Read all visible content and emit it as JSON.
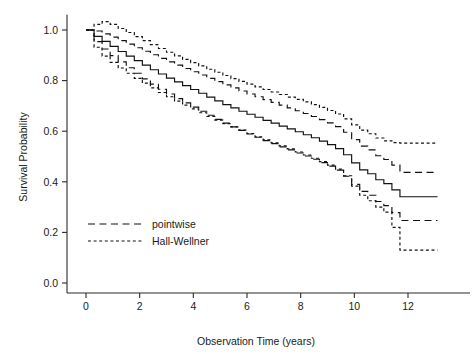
{
  "chart_data": {
    "type": "line",
    "title": "",
    "subtitle": "",
    "xlabel": "Observation Time (years)",
    "ylabel": "Survival Probability",
    "xlim": [
      -0.55,
      13.2
    ],
    "ylim": [
      -0.03,
      1.06
    ],
    "xticks": [
      0,
      2,
      4,
      6,
      8,
      10,
      12
    ],
    "xticklabels": [
      "0",
      "2",
      "4",
      "6",
      "8",
      "10",
      "12"
    ],
    "yticks": [
      0.0,
      0.2,
      0.4,
      0.6,
      0.8,
      1.0
    ],
    "yticklabels": [
      "0.0",
      "0.2",
      "0.4",
      "0.6",
      "0.8",
      "1.0"
    ],
    "grid": false,
    "legend_position": "lower-left-inside",
    "step_type": "post",
    "legend": [
      {
        "label": "pointwise",
        "style": "long-dash",
        "key": "pointwise"
      },
      {
        "label": "Hall-Wellner",
        "style": "short-dash",
        "key": "hall_wellner"
      }
    ],
    "series": [
      {
        "name": "Kaplan-Meier estimate",
        "key": "estimate",
        "style": "solid",
        "x": [
          0.0,
          0.3,
          0.6,
          0.9,
          1.2,
          1.5,
          1.8,
          2.1,
          2.4,
          2.7,
          3.0,
          3.3,
          3.6,
          3.9,
          4.2,
          4.5,
          4.8,
          5.1,
          5.4,
          5.7,
          6.0,
          6.3,
          6.6,
          6.9,
          7.2,
          7.5,
          7.8,
          8.1,
          8.4,
          8.7,
          9.0,
          9.3,
          9.6,
          9.9,
          10.2,
          10.5,
          10.8,
          11.1,
          11.4,
          11.7,
          13.1
        ],
        "values": [
          1.0,
          0.975,
          0.955,
          0.935,
          0.915,
          0.897,
          0.879,
          0.861,
          0.843,
          0.826,
          0.81,
          0.795,
          0.78,
          0.765,
          0.75,
          0.735,
          0.72,
          0.705,
          0.692,
          0.679,
          0.667,
          0.655,
          0.643,
          0.632,
          0.62,
          0.609,
          0.598,
          0.586,
          0.574,
          0.561,
          0.547,
          0.531,
          0.507,
          0.475,
          0.447,
          0.432,
          0.408,
          0.393,
          0.368,
          0.341,
          0.341
        ]
      },
      {
        "name": "Pointwise upper confidence limit",
        "key": "pointwise_upper",
        "style": "long-dash",
        "x": [
          0.0,
          0.3,
          0.6,
          0.9,
          1.2,
          1.5,
          1.8,
          2.1,
          2.4,
          2.7,
          3.0,
          3.3,
          3.6,
          3.9,
          4.2,
          4.5,
          4.8,
          5.1,
          5.4,
          5.7,
          6.0,
          6.3,
          6.6,
          6.9,
          7.2,
          7.5,
          7.8,
          8.1,
          8.4,
          8.7,
          9.0,
          9.3,
          9.6,
          9.9,
          10.2,
          10.5,
          10.8,
          11.1,
          11.4,
          11.7,
          13.1
        ],
        "values": [
          1.0,
          0.996,
          0.985,
          0.972,
          0.958,
          0.944,
          0.93,
          0.916,
          0.902,
          0.888,
          0.874,
          0.861,
          0.848,
          0.835,
          0.822,
          0.809,
          0.796,
          0.783,
          0.771,
          0.759,
          0.747,
          0.736,
          0.725,
          0.714,
          0.703,
          0.692,
          0.681,
          0.67,
          0.658,
          0.646,
          0.633,
          0.618,
          0.596,
          0.567,
          0.541,
          0.526,
          0.503,
          0.488,
          0.466,
          0.437,
          0.437
        ]
      },
      {
        "name": "Pointwise lower confidence limit",
        "key": "pointwise_lower",
        "style": "long-dash",
        "x": [
          0.0,
          0.3,
          0.6,
          0.9,
          1.2,
          1.5,
          1.8,
          2.1,
          2.4,
          2.7,
          3.0,
          3.3,
          3.6,
          3.9,
          4.2,
          4.5,
          4.8,
          5.1,
          5.4,
          5.7,
          6.0,
          6.3,
          6.6,
          6.9,
          7.2,
          7.5,
          7.8,
          8.1,
          8.4,
          8.7,
          9.0,
          9.3,
          9.6,
          9.9,
          10.2,
          10.5,
          10.8,
          11.1,
          11.4,
          11.7,
          13.1
        ],
        "values": [
          1.0,
          0.954,
          0.925,
          0.899,
          0.874,
          0.851,
          0.829,
          0.807,
          0.786,
          0.766,
          0.747,
          0.729,
          0.712,
          0.695,
          0.679,
          0.663,
          0.647,
          0.632,
          0.617,
          0.603,
          0.589,
          0.576,
          0.563,
          0.551,
          0.538,
          0.526,
          0.514,
          0.502,
          0.489,
          0.476,
          0.462,
          0.446,
          0.422,
          0.39,
          0.362,
          0.347,
          0.322,
          0.306,
          0.278,
          0.247,
          0.247
        ]
      },
      {
        "name": "Hall-Wellner upper confidence band",
        "key": "hall_wellner_upper",
        "style": "short-dash",
        "x": [
          0.0,
          0.3,
          0.6,
          0.9,
          1.2,
          1.5,
          1.8,
          2.1,
          2.4,
          2.7,
          3.0,
          3.3,
          3.6,
          3.9,
          4.2,
          4.5,
          4.8,
          5.1,
          5.4,
          5.7,
          6.0,
          6.3,
          6.6,
          6.9,
          7.2,
          7.5,
          7.8,
          8.1,
          8.4,
          8.7,
          9.0,
          9.3,
          9.6,
          9.9,
          10.2,
          10.5,
          10.8,
          11.1,
          11.4,
          11.7,
          13.1
        ],
        "values": [
          1.0,
          1.022,
          1.033,
          1.022,
          1.006,
          0.99,
          0.974,
          0.958,
          0.942,
          0.927,
          0.912,
          0.898,
          0.884,
          0.871,
          0.858,
          0.845,
          0.833,
          0.82,
          0.808,
          0.797,
          0.786,
          0.775,
          0.765,
          0.755,
          0.745,
          0.735,
          0.726,
          0.716,
          0.705,
          0.694,
          0.682,
          0.668,
          0.649,
          0.625,
          0.604,
          0.59,
          0.573,
          0.562,
          0.555,
          0.553,
          0.553
        ]
      },
      {
        "name": "Hall-Wellner lower confidence band",
        "key": "hall_wellner_lower",
        "style": "short-dash",
        "x": [
          0.0,
          0.3,
          0.6,
          0.9,
          1.2,
          1.5,
          1.8,
          2.1,
          2.4,
          2.7,
          3.0,
          3.3,
          3.6,
          3.9,
          4.2,
          4.5,
          4.8,
          5.1,
          5.4,
          5.7,
          6.0,
          6.3,
          6.6,
          6.9,
          7.2,
          7.5,
          7.8,
          8.1,
          8.4,
          8.7,
          9.0,
          9.3,
          9.6,
          9.9,
          10.2,
          10.5,
          10.8,
          11.1,
          11.4,
          11.7,
          13.1
        ],
        "values": [
          1.0,
          0.932,
          0.897,
          0.872,
          0.85,
          0.829,
          0.809,
          0.79,
          0.771,
          0.753,
          0.736,
          0.719,
          0.703,
          0.688,
          0.673,
          0.658,
          0.644,
          0.63,
          0.617,
          0.604,
          0.591,
          0.578,
          0.566,
          0.554,
          0.542,
          0.53,
          0.518,
          0.506,
          0.493,
          0.48,
          0.466,
          0.45,
          0.424,
          0.383,
          0.347,
          0.325,
          0.3,
          0.28,
          0.22,
          0.13,
          0.13
        ]
      }
    ]
  }
}
